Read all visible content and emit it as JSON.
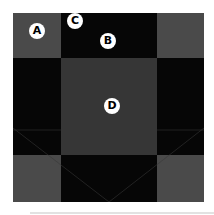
{
  "diagram": {
    "colors": {
      "grey": "#4a4a4a",
      "center": "#363636",
      "black": "#060606",
      "badge_bg": "#ffffff",
      "badge_text": "#000000"
    },
    "cells": [
      {
        "row": 0,
        "col": 0,
        "tone": "grey"
      },
      {
        "row": 0,
        "col": 1,
        "tone": "black"
      },
      {
        "row": 0,
        "col": 2,
        "tone": "grey"
      },
      {
        "row": 1,
        "col": 0,
        "tone": "black"
      },
      {
        "row": 1,
        "col": 1,
        "tone": "center"
      },
      {
        "row": 1,
        "col": 2,
        "tone": "black"
      },
      {
        "row": 2,
        "col": 0,
        "tone": "grey"
      },
      {
        "row": 2,
        "col": 1,
        "tone": "black"
      },
      {
        "row": 2,
        "col": 2,
        "tone": "grey"
      }
    ],
    "badges": [
      {
        "label": "A",
        "x": 37,
        "y": 31
      },
      {
        "label": "C",
        "x": 75,
        "y": 21
      },
      {
        "label": "B",
        "x": 108,
        "y": 41
      },
      {
        "label": "D",
        "x": 112,
        "y": 106
      }
    ]
  }
}
